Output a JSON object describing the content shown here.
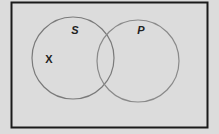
{
  "diagram": {
    "type": "venn",
    "background": "#dcdcdc",
    "frame_color": "#1a1a1a",
    "circle_color": "#7a7a7a",
    "sets": [
      {
        "label": "S",
        "cx": 73,
        "cy": 58,
        "r": 41
      },
      {
        "label": "P",
        "cx": 138,
        "cy": 61,
        "r": 41
      }
    ],
    "marks": [
      {
        "label": "X",
        "x": 49,
        "y": 59
      }
    ]
  }
}
